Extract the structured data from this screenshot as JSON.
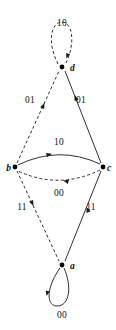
{
  "diagram": {
    "type": "state-transition-graph",
    "width": 116,
    "height": 330,
    "background_color": "#ffffff",
    "stroke_color": "#1a1a1a",
    "label_color": "#111111",
    "nodes": [
      {
        "id": "d",
        "label": "d",
        "x": 62,
        "y": 67,
        "label_x": 70,
        "label_y": 71
      },
      {
        "id": "b",
        "label": "b",
        "x": 15,
        "y": 167,
        "label_x": 4,
        "label_y": 171
      },
      {
        "id": "c",
        "label": "c",
        "x": 103,
        "y": 167,
        "label_x": 106,
        "label_y": 171
      },
      {
        "id": "a",
        "label": "a",
        "x": 62,
        "y": 265,
        "label_x": 70,
        "label_y": 269
      }
    ],
    "edges": [
      {
        "id": "d-self-loop",
        "from": "d",
        "to": "d",
        "label": "10",
        "style": "dashed",
        "label_x": 62,
        "label_y": 26,
        "path": "M 58 64 C 46 40 52 22 62 22 C 72 22 76 42 66 63",
        "arrow": {
          "x": 66.5,
          "y": 58.5,
          "angle": 108
        }
      },
      {
        "id": "b-to-d",
        "from": "b",
        "to": "d",
        "label": "01",
        "style": "dashed",
        "label_x": 30,
        "label_y": 103,
        "path": "M 17 163 L 59 71",
        "arrow": {
          "x": 44.5,
          "y": 103,
          "angle": -65.5
        }
      },
      {
        "id": "c-to-d",
        "from": "c",
        "to": "d",
        "label": "01",
        "style": "solid",
        "label_x": 81,
        "label_y": 103,
        "path": "M 101 163 L 65 71",
        "arrow": {
          "x": 74.5,
          "y": 95,
          "angle": -111.5
        }
      },
      {
        "id": "b-to-c",
        "from": "b",
        "to": "c",
        "label": "10",
        "style": "solid",
        "label_x": 59,
        "label_y": 145,
        "path": "M 18 165 Q 59 145 100 164",
        "arrow": {
          "x": 52,
          "y": 153.8,
          "angle": -15
        }
      },
      {
        "id": "c-to-b",
        "from": "c",
        "to": "b",
        "label": "00",
        "style": "dashed",
        "label_x": 59,
        "label_y": 196,
        "path": "M 100 170 Q 59 190 18 171",
        "arrow": {
          "x": 63,
          "y": 180.5,
          "angle": 194
        }
      },
      {
        "id": "b-to-a",
        "from": "b",
        "to": "a",
        "label": "11",
        "style": "dashed",
        "label_x": 22,
        "label_y": 210,
        "path": "M 17 171 L 59 261",
        "arrow": {
          "x": 33.5,
          "y": 206,
          "angle": 65
        }
      },
      {
        "id": "a-to-c",
        "from": "a",
        "to": "c",
        "label": "11",
        "style": "solid",
        "label_x": 91,
        "label_y": 210,
        "path": "M 65 261 L 101 171",
        "arrow": {
          "x": 86.5,
          "y": 207,
          "angle": -112
        }
      },
      {
        "id": "a-self-loop",
        "from": "a",
        "to": "a",
        "label": "00",
        "style": "solid",
        "label_x": 62,
        "label_y": 318,
        "path": "M 60 268 C 46 288 46 306 57 306 C 70 306 72 286 64 268",
        "arrow": {
          "x": 46.5,
          "y": 296,
          "angle": 104
        }
      }
    ]
  }
}
